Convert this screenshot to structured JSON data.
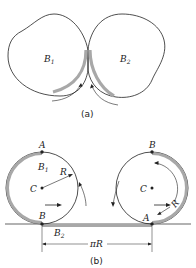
{
  "figure": {
    "part_a": {
      "caption": "(a)",
      "body1_label": "B",
      "body1_sub": "1",
      "body2_label": "B",
      "body2_sub": "2"
    },
    "part_b": {
      "caption": "(b)",
      "left_wheel": {
        "top_point": "A",
        "bottom_point": "B",
        "center": "C",
        "radius_label": "R",
        "body_label": "B",
        "body_sub": "1"
      },
      "right_wheel": {
        "top_point": "B",
        "bottom_point": "A",
        "center": "C",
        "radius_label": "R"
      },
      "ground_label": "B",
      "ground_sub": "2",
      "distance_label": "πR"
    },
    "colors": {
      "line": "#222222",
      "contact_shade": "#a8a8a8",
      "background": "#ffffff"
    }
  }
}
